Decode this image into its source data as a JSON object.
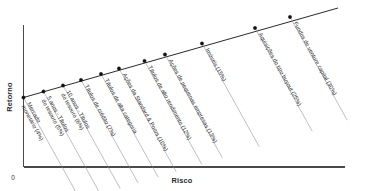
{
  "chart_data": {
    "type": "scatter",
    "title": "",
    "subtitle": "",
    "xlabel": "Risco",
    "ylabel": "Retorno",
    "grid": false,
    "legend": null,
    "axis_origin_label": "0",
    "xlim": [
      0,
      100
    ],
    "ylim": [
      0,
      100
    ],
    "x_ticks": [],
    "y_ticks": [],
    "note": "Linha ascendente mostrando a relacao risco-retorno de classes de ativos",
    "categories": [
      "Mercado monetário (4%)",
      "5 anos - Títulos do tesouro (5%)",
      "10 anos - Títulos do tesouro (6%)",
      "Títulos de crédito (7%)",
      "Títulos de alta categoria",
      "Ações da Standard & Poors (10%)",
      "Títulos de alto rendimento (12%)",
      "Ações de pequenas empresas (13%)",
      "Imóveis (15%)",
      "Aquisições do tipo buyout (25%)",
      "Fundos de venture capital (30%)"
    ],
    "values": [
      4,
      5,
      6,
      7,
      8,
      10,
      12,
      13,
      15,
      25,
      30
    ],
    "points": [
      {
        "label": "Mercado monetário (4%)",
        "value": 4,
        "px": 23.5,
        "py": 97.5,
        "label_lines": [
          "Mercado",
          "monetário (4%)"
        ]
      },
      {
        "label": "5 anos - Títulos do tesouro (5%)",
        "value": 5,
        "px": 43.5,
        "py": 91.5,
        "label_lines": [
          "5 anos - Títulos",
          "do tesouro (5%)"
        ]
      },
      {
        "label": "10 anos - Títulos do tesouro (6%)",
        "value": 6,
        "px": 63.0,
        "py": 85.5,
        "label_lines": [
          "10 anos - Títulos",
          "do tesouro (6%)"
        ]
      },
      {
        "label": "Títulos de crédito (7%)",
        "value": 7,
        "px": 81.0,
        "py": 80.0,
        "label_lines": [
          "Títulos de crédito (7%)"
        ]
      },
      {
        "label": "Títulos de alta categoria",
        "value": 8,
        "px": 101.0,
        "py": 74.0,
        "label_lines": [
          "Títulos de alta categoria"
        ]
      },
      {
        "label": "Ações da Standard & Poors (10%)",
        "value": 10,
        "px": 119.0,
        "py": 68.5,
        "label_lines": [
          "Ações da Standard & Poors (10%)"
        ]
      },
      {
        "label": "Títulos de alto rendimento (12%)",
        "value": 12,
        "px": 144.5,
        "py": 61.0,
        "label_lines": [
          "Títulos de alto rendimento (12%)"
        ]
      },
      {
        "label": "Ações de pequenas empresas (13%)",
        "value": 13,
        "px": 165.0,
        "py": 54.5,
        "label_lines": [
          "Ações de pequenas empresas (13%)"
        ]
      },
      {
        "label": "Imóveis (15%)",
        "value": 15,
        "px": 202.0,
        "py": 43.5,
        "label_lines": [
          "Imóveis (15%)"
        ]
      },
      {
        "label": "Aquisições do tipo buyout (25%)",
        "value": 25,
        "px": 255.0,
        "py": 28.0,
        "label_lines": [
          "Aquisições do tipo buyout (25%)"
        ]
      },
      {
        "label": "Fundos de venture capital (30%)",
        "value": 30,
        "px": 290.0,
        "py": 17.0,
        "label_lines": [
          "Fundos de venture capital (30%)"
        ]
      }
    ]
  },
  "axes": {
    "y_title": "Retorno",
    "x_title": "Risco",
    "origin": "0"
  }
}
